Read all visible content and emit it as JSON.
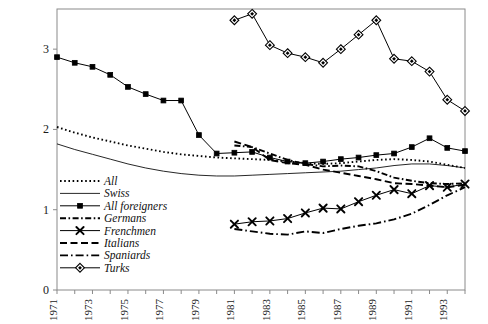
{
  "chart_data": {
    "type": "line",
    "title": "",
    "subtitle": "",
    "xlabel": "",
    "ylabel": "",
    "xlim": [
      1971,
      1994
    ],
    "ylim": [
      0,
      3.5
    ],
    "yticks": [
      0,
      1,
      2,
      3
    ],
    "ytick_labels": [
      "0",
      "1",
      "2",
      "3"
    ],
    "xticks": [
      1971,
      1972,
      1973,
      1974,
      1975,
      1976,
      1977,
      1978,
      1979,
      1980,
      1981,
      1982,
      1983,
      1984,
      1985,
      1986,
      1987,
      1988,
      1989,
      1990,
      1991,
      1992,
      1993,
      1994
    ],
    "xtick_labels": [
      "1971",
      "",
      "1973",
      "",
      "1975",
      "",
      "1977",
      "",
      "1979",
      "",
      "1981",
      "",
      "1983",
      "",
      "1985",
      "",
      "1987",
      "",
      "1989",
      "",
      "1991",
      "",
      "1993",
      ""
    ],
    "grid": false,
    "frame": true,
    "legend_position": "lower-left-inside",
    "series": [
      {
        "name": "All",
        "marker": "none",
        "line_style": "dotted",
        "x": [
          1971,
          1972,
          1973,
          1974,
          1975,
          1976,
          1977,
          1978,
          1979,
          1980,
          1981,
          1982,
          1983,
          1984,
          1985,
          1986,
          1987,
          1988,
          1989,
          1990,
          1991,
          1992,
          1993,
          1994
        ],
        "values": [
          2.03,
          1.96,
          1.9,
          1.85,
          1.8,
          1.76,
          1.72,
          1.69,
          1.67,
          1.65,
          1.64,
          1.63,
          1.62,
          1.6,
          1.58,
          1.57,
          1.58,
          1.6,
          1.62,
          1.63,
          1.62,
          1.6,
          1.56,
          1.52
        ]
      },
      {
        "name": "Swiss",
        "marker": "none",
        "line_style": "solid-thin",
        "x": [
          1971,
          1972,
          1973,
          1974,
          1975,
          1976,
          1977,
          1978,
          1979,
          1980,
          1981,
          1982,
          1983,
          1984,
          1985,
          1986,
          1987,
          1988,
          1989,
          1990,
          1991,
          1992,
          1993,
          1994
        ],
        "values": [
          1.82,
          1.75,
          1.69,
          1.63,
          1.57,
          1.52,
          1.48,
          1.45,
          1.43,
          1.42,
          1.42,
          1.43,
          1.44,
          1.45,
          1.46,
          1.47,
          1.48,
          1.5,
          1.52,
          1.55,
          1.57,
          1.57,
          1.55,
          1.52
        ]
      },
      {
        "name": "All foreigners",
        "marker": "square",
        "line_style": "solid",
        "x": [
          1971,
          1972,
          1973,
          1974,
          1975,
          1976,
          1977,
          1978,
          1979,
          1980,
          1981,
          1982,
          1983,
          1984,
          1985,
          1986,
          1987,
          1988,
          1989,
          1990,
          1991,
          1992,
          1993,
          1994
        ],
        "values": [
          2.9,
          2.83,
          2.78,
          2.68,
          2.53,
          2.44,
          2.36,
          2.36,
          1.93,
          1.7,
          1.71,
          1.72,
          1.65,
          1.6,
          1.58,
          1.6,
          1.63,
          1.65,
          1.68,
          1.7,
          1.78,
          1.89,
          1.77,
          1.73
        ]
      },
      {
        "name": "Germans",
        "marker": "none",
        "line_style": "dashdot",
        "x": [
          1981,
          1982,
          1983,
          1984,
          1985,
          1986,
          1987,
          1988,
          1989,
          1990,
          1991,
          1992,
          1993,
          1994
        ],
        "values": [
          1.8,
          1.78,
          1.7,
          1.62,
          1.57,
          1.54,
          1.55,
          1.54,
          1.48,
          1.4,
          1.36,
          1.33,
          1.32,
          1.33
        ]
      },
      {
        "name": "Frenchmen",
        "marker": "x",
        "line_style": "solid",
        "x": [
          1981,
          1982,
          1983,
          1984,
          1985,
          1986,
          1987,
          1988,
          1989,
          1990,
          1991,
          1992,
          1993,
          1994
        ],
        "values": [
          0.82,
          0.85,
          0.86,
          0.89,
          0.96,
          1.02,
          1.01,
          1.1,
          1.18,
          1.25,
          1.2,
          1.3,
          1.28,
          1.32
        ]
      },
      {
        "name": "Italians",
        "marker": "none",
        "line_style": "dashed",
        "x": [
          1981,
          1982,
          1983,
          1984,
          1985,
          1986,
          1987,
          1988,
          1989,
          1990,
          1991,
          1992,
          1993,
          1994
        ],
        "values": [
          1.85,
          1.78,
          1.62,
          1.58,
          1.56,
          1.5,
          1.46,
          1.42,
          1.38,
          1.33,
          1.32,
          1.3,
          1.28,
          1.31
        ]
      },
      {
        "name": "Spaniards",
        "marker": "none",
        "line_style": "longdashdot",
        "x": [
          1981,
          1982,
          1983,
          1984,
          1985,
          1986,
          1987,
          1988,
          1989,
          1990,
          1991,
          1992,
          1993,
          1994
        ],
        "values": [
          0.76,
          0.73,
          0.7,
          0.69,
          0.73,
          0.71,
          0.76,
          0.8,
          0.83,
          0.88,
          0.95,
          1.06,
          1.18,
          1.28
        ]
      },
      {
        "name": "Turks",
        "marker": "diamond",
        "line_style": "solid",
        "x": [
          1981,
          1982,
          1983,
          1984,
          1985,
          1986,
          1987,
          1988,
          1989,
          1990,
          1991,
          1992,
          1993,
          1994
        ],
        "values": [
          3.36,
          3.44,
          3.05,
          2.95,
          2.9,
          2.83,
          3.0,
          3.18,
          3.36,
          2.88,
          2.85,
          2.72,
          2.37,
          2.23
        ]
      }
    ],
    "legend": [
      {
        "label": "All",
        "style": "dotted",
        "marker": "none"
      },
      {
        "label": "Swiss",
        "style": "solid-thin",
        "marker": "none"
      },
      {
        "label": "All foreigners",
        "style": "solid",
        "marker": "square"
      },
      {
        "label": "Germans",
        "style": "dashdot",
        "marker": "none"
      },
      {
        "label": "Frenchmen",
        "style": "solid",
        "marker": "x"
      },
      {
        "label": "Italians",
        "style": "dashed",
        "marker": "none"
      },
      {
        "label": "Spaniards",
        "style": "longdashdot",
        "marker": "none"
      },
      {
        "label": "Turks",
        "style": "solid",
        "marker": "diamond"
      }
    ],
    "colors": {
      "line": "#000000",
      "frame": "#8a8a8a",
      "text": "#1a1a1a"
    }
  }
}
